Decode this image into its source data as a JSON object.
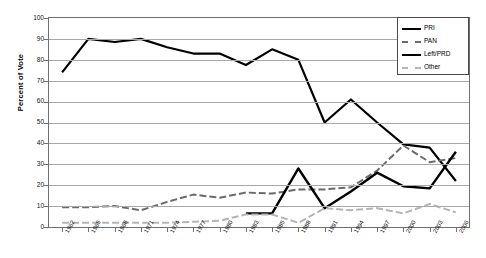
{
  "chart_data": {
    "type": "line",
    "title": "",
    "xlabel": "",
    "ylabel": "Percent of Vote",
    "ylim": [
      0,
      100
    ],
    "ytick_step": 10,
    "yticks": [
      0,
      10,
      20,
      30,
      40,
      50,
      60,
      70,
      80,
      90,
      100
    ],
    "grid": true,
    "legend_position": "top-right",
    "categories": [
      "1962",
      "1965",
      "1968",
      "1971",
      "1974",
      "1977",
      "1980",
      "1983",
      "1985",
      "1988",
      "1991",
      "1994",
      "1997",
      "2000",
      "2003",
      "2006"
    ],
    "series": [
      {
        "name": "PRI",
        "color": "#000000",
        "style": "solid",
        "values": [
          74,
          90,
          88.5,
          90,
          86,
          83,
          83,
          77.5,
          85,
          80,
          50,
          61,
          50,
          39.5,
          38,
          22
        ]
      },
      {
        "name": "PAN",
        "color": "#6b6b6b",
        "style": "dashed",
        "values": [
          9.5,
          9.5,
          10,
          8,
          12,
          15.5,
          14,
          16.5,
          16,
          18,
          18,
          19,
          27,
          39,
          31,
          33
        ]
      },
      {
        "name": "Left/PRD",
        "color": "#000000",
        "style": "solid-thick",
        "values": [
          null,
          null,
          null,
          null,
          null,
          null,
          null,
          6.5,
          6.5,
          28,
          9,
          17,
          26,
          19.5,
          18.5,
          36
        ]
      },
      {
        "name": "Other",
        "color": "#b5b5b5",
        "style": "dashed",
        "values": [
          2,
          2,
          2,
          2,
          2,
          2.5,
          3,
          6,
          6,
          2,
          9,
          8,
          9,
          6.5,
          11,
          7
        ]
      }
    ]
  },
  "legend": {
    "items": [
      {
        "label": "PRI"
      },
      {
        "label": "PAN"
      },
      {
        "label": "Left/PRD"
      },
      {
        "label": "Other"
      }
    ]
  },
  "axis": {
    "y_title": "Percent of Vote"
  }
}
